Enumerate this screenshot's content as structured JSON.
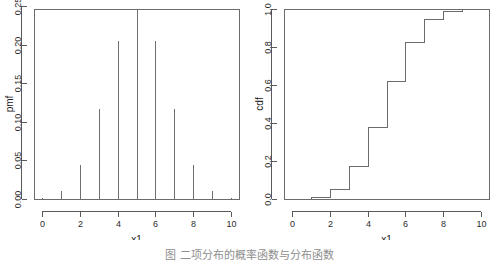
{
  "figure": {
    "caption": "图 二项分布的概率函数与分布函数"
  },
  "chart_data": [
    {
      "type": "bar",
      "panel_name": "pmf-panel",
      "title": "",
      "xlabel": "x1",
      "ylabel": "pmf",
      "x": [
        0,
        1,
        2,
        3,
        4,
        5,
        6,
        7,
        8,
        9,
        10
      ],
      "values": [
        0.001,
        0.0098,
        0.0439,
        0.1172,
        0.2051,
        0.2461,
        0.2051,
        0.1172,
        0.0439,
        0.0098,
        0.001
      ],
      "xlim": [
        -0.4,
        10.4
      ],
      "ylim": [
        0.0,
        0.2461
      ],
      "xticks": [
        0,
        2,
        4,
        6,
        8,
        10
      ],
      "xticklabels": [
        "0",
        "2",
        "4",
        "6",
        "8",
        "10"
      ],
      "yticks": [
        0.0,
        0.05,
        0.1,
        0.15,
        0.2,
        0.25
      ],
      "yticklabels": [
        "0.00",
        "0.05",
        "0.10",
        "0.15",
        "0.20",
        "0.25"
      ],
      "grid": false,
      "legend": "none"
    },
    {
      "type": "line",
      "panel_name": "cdf-panel",
      "title": "",
      "xlabel": "x1",
      "ylabel": "cdf",
      "x": [
        0,
        1,
        2,
        3,
        4,
        5,
        6,
        7,
        8,
        9,
        10
      ],
      "values": [
        0.001,
        0.0107,
        0.0547,
        0.1719,
        0.377,
        0.623,
        0.8281,
        0.9453,
        0.9893,
        0.999,
        1.0
      ],
      "xlim": [
        -0.4,
        10.4
      ],
      "ylim": [
        0.0,
        1.0
      ],
      "xticks": [
        0,
        2,
        4,
        6,
        8,
        10
      ],
      "xticklabels": [
        "0",
        "2",
        "4",
        "6",
        "8",
        "10"
      ],
      "yticks": [
        0.0,
        0.2,
        0.4,
        0.6,
        0.8,
        1.0
      ],
      "yticklabels": [
        "0.0",
        "0.2",
        "0.4",
        "0.6",
        "0.8",
        "1.0"
      ],
      "grid": false,
      "legend": "none",
      "step_style": "post"
    }
  ]
}
